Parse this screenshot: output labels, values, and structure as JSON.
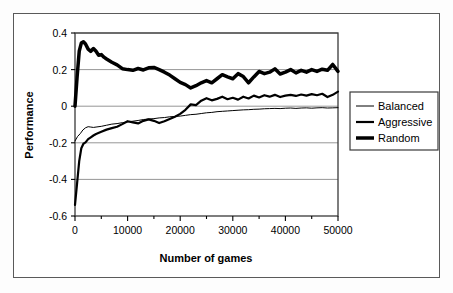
{
  "chart_data": {
    "type": "line",
    "title": "",
    "xlabel": "Number of games",
    "ylabel": "Performance",
    "xlim": [
      0,
      50000
    ],
    "ylim": [
      -0.6,
      0.4
    ],
    "xticks": [
      0,
      10000,
      20000,
      30000,
      40000,
      50000
    ],
    "xtick_labels": [
      "0",
      "10000",
      "20000",
      "30000",
      "40000",
      "50000"
    ],
    "yticks": [
      -0.6,
      -0.4,
      -0.2,
      0,
      0.2,
      0.4
    ],
    "ytick_labels": [
      "-0.6",
      "-0.4",
      "-0.2",
      "0",
      "0.2",
      "0.4"
    ],
    "xminor_step": 5000,
    "grid": "horizontal",
    "legend_position": "right",
    "series": [
      {
        "name": "Balanced",
        "line_width": 1,
        "color": "#000000",
        "x": [
          0,
          500,
          1000,
          1500,
          2000,
          2500,
          3000,
          3500,
          4000,
          5000,
          6000,
          7000,
          8000,
          9000,
          10000,
          11000,
          12000,
          13000,
          14000,
          15000,
          16000,
          17000,
          18000,
          19000,
          20000,
          21000,
          22000,
          23000,
          24000,
          25000,
          26000,
          27000,
          28000,
          29000,
          30000,
          31000,
          32000,
          33000,
          34000,
          35000,
          36000,
          37000,
          38000,
          39000,
          40000,
          41000,
          42000,
          43000,
          44000,
          45000,
          46000,
          47000,
          48000,
          49000,
          50000
        ],
        "y": [
          -0.19,
          -0.165,
          -0.15,
          -0.13,
          -0.118,
          -0.112,
          -0.114,
          -0.116,
          -0.114,
          -0.11,
          -0.104,
          -0.098,
          -0.095,
          -0.09,
          -0.086,
          -0.082,
          -0.078,
          -0.073,
          -0.07,
          -0.068,
          -0.064,
          -0.062,
          -0.058,
          -0.056,
          -0.054,
          -0.05,
          -0.046,
          -0.044,
          -0.04,
          -0.036,
          -0.034,
          -0.03,
          -0.028,
          -0.026,
          -0.024,
          -0.022,
          -0.02,
          -0.019,
          -0.017,
          -0.016,
          -0.014,
          -0.013,
          -0.012,
          -0.013,
          -0.011,
          -0.01,
          -0.012,
          -0.01,
          -0.009,
          -0.011,
          -0.009,
          -0.008,
          -0.01,
          -0.009,
          -0.008
        ]
      },
      {
        "name": "Aggressive",
        "line_width": 2.2,
        "color": "#000000",
        "x": [
          0,
          400,
          800,
          1200,
          1600,
          2000,
          2500,
          3000,
          3500,
          4000,
          5000,
          6000,
          7000,
          8000,
          9000,
          10000,
          11000,
          12000,
          13000,
          14000,
          15000,
          16000,
          17000,
          18000,
          19000,
          20000,
          21000,
          22000,
          23000,
          24000,
          25000,
          26000,
          27000,
          28000,
          29000,
          30000,
          31000,
          32000,
          33000,
          34000,
          35000,
          36000,
          37000,
          38000,
          39000,
          40000,
          41000,
          42000,
          43000,
          44000,
          45000,
          46000,
          47000,
          48000,
          49000,
          50000
        ],
        "y": [
          -0.54,
          -0.42,
          -0.3,
          -0.23,
          -0.205,
          -0.198,
          -0.18,
          -0.17,
          -0.16,
          -0.152,
          -0.14,
          -0.128,
          -0.12,
          -0.112,
          -0.098,
          -0.082,
          -0.088,
          -0.094,
          -0.08,
          -0.072,
          -0.08,
          -0.092,
          -0.082,
          -0.07,
          -0.058,
          -0.042,
          -0.02,
          0.01,
          0.006,
          0.03,
          0.044,
          0.032,
          0.04,
          0.052,
          0.038,
          0.046,
          0.036,
          0.052,
          0.042,
          0.058,
          0.048,
          0.06,
          0.052,
          0.062,
          0.05,
          0.058,
          0.062,
          0.056,
          0.064,
          0.058,
          0.066,
          0.06,
          0.068,
          0.05,
          0.062,
          0.08
        ]
      },
      {
        "name": "Random",
        "line_width": 3.5,
        "color": "#000000",
        "x": [
          0,
          400,
          800,
          1200,
          1600,
          2000,
          2500,
          3000,
          3500,
          4000,
          4500,
          5000,
          5500,
          6000,
          7000,
          8000,
          9000,
          10000,
          11000,
          12000,
          13000,
          14000,
          15000,
          16000,
          17000,
          18000,
          19000,
          20000,
          21000,
          22000,
          23000,
          24000,
          25000,
          26000,
          27000,
          28000,
          29000,
          30000,
          31000,
          32000,
          33000,
          34000,
          35000,
          36000,
          37000,
          38000,
          39000,
          40000,
          41000,
          42000,
          43000,
          44000,
          45000,
          46000,
          47000,
          48000,
          49000,
          50000
        ],
        "y": [
          0.0,
          0.16,
          0.3,
          0.345,
          0.352,
          0.34,
          0.312,
          0.3,
          0.315,
          0.3,
          0.278,
          0.282,
          0.268,
          0.258,
          0.24,
          0.226,
          0.205,
          0.2,
          0.196,
          0.206,
          0.198,
          0.21,
          0.212,
          0.2,
          0.186,
          0.17,
          0.15,
          0.13,
          0.118,
          0.1,
          0.112,
          0.128,
          0.14,
          0.128,
          0.15,
          0.172,
          0.16,
          0.15,
          0.178,
          0.162,
          0.128,
          0.16,
          0.19,
          0.178,
          0.186,
          0.204,
          0.176,
          0.186,
          0.2,
          0.182,
          0.196,
          0.186,
          0.2,
          0.19,
          0.202,
          0.196,
          0.228,
          0.19
        ]
      }
    ]
  },
  "legend": {
    "items": [
      {
        "label": "Balanced"
      },
      {
        "label": "Aggressive"
      },
      {
        "label": "Random"
      }
    ]
  }
}
